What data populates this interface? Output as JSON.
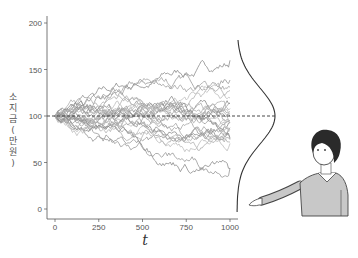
{
  "chart_data": {
    "type": "line",
    "title": "",
    "xlabel": "t",
    "ylabel": "소지금 (만 원)",
    "xlim": [
      0,
      1000
    ],
    "ylim": [
      0,
      200
    ],
    "x_ticks": [
      "0",
      "250",
      "500",
      "750",
      "1000"
    ],
    "y_ticks": [
      "0",
      "50",
      "100",
      "150",
      "200"
    ],
    "grid": false,
    "reference_line": {
      "y": 100,
      "style": "dashed"
    },
    "series_end_values_approx": [
      157,
      138,
      130,
      125,
      120,
      115,
      112,
      108,
      105,
      103,
      100,
      98,
      96,
      94,
      92,
      90,
      88,
      86,
      84,
      82,
      80,
      78,
      75,
      72,
      68,
      45,
      42
    ],
    "envelope": {
      "x": [
        0,
        250,
        500,
        750,
        1000
      ],
      "max": [
        100,
        132,
        150,
        155,
        160
      ],
      "min": [
        100,
        75,
        62,
        45,
        40
      ]
    },
    "side_distribution": "normal density curve centered at 100 drawn to the right of the plot",
    "colors": {
      "paths": "#9a9a9a",
      "axis": "#555555",
      "curve": "#333333"
    }
  },
  "illustration": {
    "person": "short-haired person in grey sweater gesturing toward the chart",
    "sweater_color": "#c8c8c8",
    "hair_color": "#2a2a2a"
  },
  "ylabel_chars": [
    "소",
    "지",
    "금",
    "(",
    "만",
    "원",
    ")"
  ]
}
